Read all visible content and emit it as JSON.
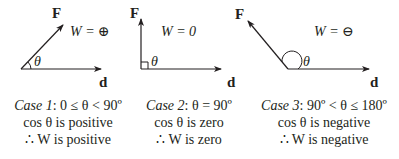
{
  "diagram": {
    "colors": {
      "line": "#231f20",
      "background": "#ffffff"
    },
    "cases": [
      {
        "force_label": "F",
        "displacement_label": "d",
        "angle_label": "θ",
        "work_label": "W = ⊕",
        "caption_case": "Case 1",
        "caption_condition": ": 0 ≤ θ < 90º",
        "caption_cos": "cos θ is positive",
        "caption_work": "∴ W is positive"
      },
      {
        "force_label": "F",
        "displacement_label": "d",
        "angle_label": "θ",
        "work_label": "W = 0",
        "caption_case": "Case 2",
        "caption_condition": ": θ = 90º",
        "caption_cos": "cos θ is zero",
        "caption_work": "∴ W is zero"
      },
      {
        "force_label": "F",
        "displacement_label": "d",
        "angle_label": "θ",
        "work_label": "W = ⊖",
        "caption_case": "Case 3",
        "caption_condition": ": 90º < θ ≤ 180º",
        "caption_cos": "cos θ is negative",
        "caption_work": "∴ W is negative"
      }
    ]
  }
}
